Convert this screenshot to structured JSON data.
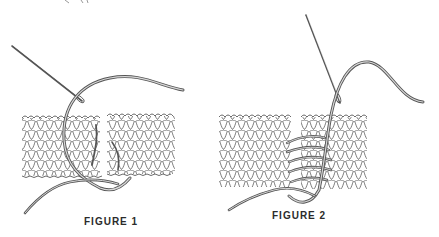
{
  "figures": [
    {
      "id": "figure-1",
      "caption": "FIGURE 1",
      "description": "Tapestry needle with yarn weaving between two pieces of knitted stockinette fabric"
    },
    {
      "id": "figure-2",
      "caption": "FIGURE 2",
      "description": "Needle and yarn seaming two knitted pieces with multiple horizontal yarn strands pulled through"
    }
  ],
  "colors": {
    "ink": "#3a3a3a",
    "background": "#ffffff",
    "yarn": "#6b6b6b",
    "caption": "#2b2b2b"
  }
}
